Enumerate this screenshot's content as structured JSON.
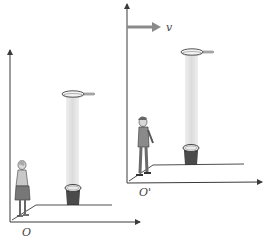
{
  "figure": {
    "frames": [
      {
        "id": "stationary",
        "origin_label": "O",
        "observer": "woman",
        "clock": "light-clock"
      },
      {
        "id": "moving",
        "origin_label": "O'",
        "observer": "man",
        "clock": "light-clock",
        "velocity_label": "v"
      }
    ]
  },
  "colors": {
    "axis": "#3a3a3a",
    "velocity_arrow": "#8a8a8a",
    "light_beam": "#e4e4e4"
  }
}
